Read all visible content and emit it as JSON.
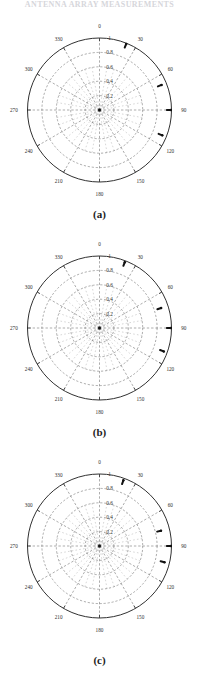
{
  "page": {
    "header_text": "ANTENNA ARRAY MEASUREMENTS",
    "background_color": "#ffffff",
    "ink_color": "#1a1a1a"
  },
  "chart_data": [
    {
      "type": "scatter",
      "name": "polar-plot-a",
      "caption": "(a)",
      "projection": "polar",
      "grid": true,
      "grid_style": "dashed",
      "legend": "none",
      "title": "",
      "xlabel": "",
      "ylabel": "",
      "theta_unit": "degrees",
      "theta_zero_location": "N",
      "theta_direction": "clockwise",
      "angular_ticks": [
        0,
        30,
        60,
        90,
        120,
        150,
        180,
        210,
        240,
        270,
        300,
        330
      ],
      "angular_tick_labels": [
        "0",
        "30",
        "60",
        "90",
        "120",
        "150",
        "180",
        "210",
        "240",
        "270",
        "300",
        "330"
      ],
      "radial_ticks": [
        0.2,
        0.4,
        0.6,
        0.8,
        1
      ],
      "radial_tick_labels": [
        "0.2",
        "0.4",
        "0.6",
        "0.8",
        "1"
      ],
      "rlim": [
        0,
        1
      ],
      "points": [
        {
          "theta": 22,
          "r": 0.99
        },
        {
          "theta": 68,
          "r": 0.93
        },
        {
          "theta": 90,
          "r": 0.99
        },
        {
          "theta": 112,
          "r": 0.94
        }
      ]
    },
    {
      "type": "scatter",
      "name": "polar-plot-b",
      "caption": "(b)",
      "projection": "polar",
      "grid": true,
      "grid_style": "dashed",
      "legend": "none",
      "title": "",
      "xlabel": "",
      "ylabel": "",
      "theta_unit": "degrees",
      "theta_zero_location": "N",
      "theta_direction": "clockwise",
      "angular_ticks": [
        0,
        30,
        60,
        90,
        120,
        150,
        180,
        210,
        240,
        270,
        300,
        330
      ],
      "angular_tick_labels": [
        "0",
        "30",
        "60",
        "90",
        "120",
        "150",
        "180",
        "210",
        "240",
        "270",
        "300",
        "330"
      ],
      "radial_ticks": [
        0.2,
        0.4,
        0.6,
        0.8,
        1
      ],
      "radial_tick_labels": [
        "0.2",
        "0.4",
        "0.6",
        "0.8",
        "1"
      ],
      "rlim": [
        0,
        1
      ],
      "points": [
        {
          "theta": 21,
          "r": 0.98
        },
        {
          "theta": 72,
          "r": 0.9
        },
        {
          "theta": 90,
          "r": 0.99
        },
        {
          "theta": 110,
          "r": 0.95
        }
      ]
    },
    {
      "type": "scatter",
      "name": "polar-plot-c",
      "caption": "(c)",
      "projection": "polar",
      "grid": true,
      "grid_style": "dashed",
      "legend": "none",
      "title": "",
      "xlabel": "",
      "ylabel": "",
      "theta_unit": "degrees",
      "theta_zero_location": "N",
      "theta_direction": "clockwise",
      "angular_ticks": [
        0,
        30,
        60,
        90,
        120,
        150,
        180,
        210,
        240,
        270,
        300,
        330
      ],
      "angular_tick_labels": [
        "0",
        "30",
        "60",
        "90",
        "120",
        "150",
        "180",
        "210",
        "240",
        "270",
        "300",
        "330"
      ],
      "radial_ticks": [
        0.2,
        0.4,
        0.6,
        0.8,
        1
      ],
      "radial_tick_labels": [
        "0.2",
        "0.4",
        "0.6",
        "0.8",
        "1"
      ],
      "rlim": [
        0,
        1
      ],
      "points": [
        {
          "theta": 20,
          "r": 0.97
        },
        {
          "theta": 76,
          "r": 0.88
        },
        {
          "theta": 90,
          "r": 0.99
        },
        {
          "theta": 104,
          "r": 0.93
        }
      ]
    }
  ]
}
